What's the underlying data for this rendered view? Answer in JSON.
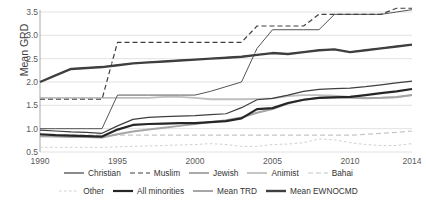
{
  "chart_data": {
    "type": "line",
    "title": "",
    "xlabel": "",
    "ylabel": "Mean GRD",
    "xlim": [
      1990,
      2014
    ],
    "ylim": [
      0.5,
      3.5
    ],
    "yticks": [
      "0.5",
      "1.0",
      "1.5",
      "2.0",
      "2.5",
      "3.0",
      "3.5"
    ],
    "ytick_values": [
      0.5,
      1.0,
      1.5,
      2.0,
      2.5,
      3.0,
      3.5
    ],
    "xticks": [
      "1990",
      "1995",
      "2000",
      "2005",
      "2010",
      "2014"
    ],
    "xtick_values": [
      1990,
      1995,
      2000,
      2005,
      2010,
      2014
    ],
    "grid": "horizontal",
    "legend_position": "bottom",
    "x": [
      1990,
      1991,
      1992,
      1993,
      1994,
      1995,
      1996,
      1997,
      1998,
      1999,
      2000,
      2001,
      2002,
      2003,
      2004,
      2005,
      2006,
      2007,
      2008,
      2009,
      2010,
      2011,
      2012,
      2013,
      2014
    ],
    "series": [
      {
        "name": "Christian",
        "style": "solid-thick-dark",
        "color": "#3f3f3f",
        "values": [
          0.97,
          0.95,
          0.93,
          0.92,
          0.9,
          1.06,
          1.2,
          1.24,
          1.26,
          1.27,
          1.28,
          1.3,
          1.32,
          1.45,
          1.62,
          1.65,
          1.72,
          1.8,
          1.84,
          1.86,
          1.87,
          1.9,
          1.94,
          1.98,
          2.02
        ]
      },
      {
        "name": "Muslim",
        "style": "dashed-dark",
        "color": "#3f3f3f",
        "values": [
          1.63,
          1.63,
          1.63,
          1.63,
          1.63,
          2.85,
          2.85,
          2.85,
          2.85,
          2.85,
          2.85,
          2.85,
          2.85,
          2.85,
          3.2,
          3.2,
          3.2,
          3.2,
          3.45,
          3.45,
          3.45,
          3.45,
          3.45,
          3.58,
          3.58
        ]
      },
      {
        "name": "Jewish",
        "style": "dashdot-dark-thin",
        "color": "#555555",
        "values": [
          1.0,
          1.0,
          1.0,
          1.0,
          1.0,
          1.72,
          1.72,
          1.72,
          1.72,
          1.72,
          1.72,
          1.8,
          1.9,
          2.0,
          2.72,
          3.12,
          3.12,
          3.12,
          3.12,
          3.45,
          3.45,
          3.45,
          3.45,
          3.5,
          3.55
        ]
      },
      {
        "name": "Animist",
        "style": "solid-light",
        "color": "#bfbfbf",
        "values": [
          1.66,
          1.66,
          1.66,
          1.66,
          1.66,
          1.66,
          1.66,
          1.66,
          1.68,
          1.68,
          1.66,
          1.63,
          1.63,
          1.63,
          1.64,
          1.65,
          1.7,
          1.72,
          1.72,
          1.71,
          1.68,
          1.66,
          1.66,
          1.67,
          1.72
        ]
      },
      {
        "name": "Bahai",
        "style": "dashed-light",
        "color": "#c6c6c6",
        "values": [
          0.86,
          0.86,
          0.86,
          0.86,
          0.86,
          0.86,
          0.86,
          0.86,
          0.86,
          0.86,
          0.86,
          0.86,
          0.86,
          0.86,
          0.86,
          0.86,
          0.86,
          0.86,
          0.86,
          0.86,
          0.86,
          0.88,
          0.9,
          0.92,
          0.95
        ]
      },
      {
        "name": "Other",
        "style": "dotted-light",
        "color": "#cfcfcf",
        "values": [
          0.6,
          0.6,
          0.6,
          0.6,
          0.6,
          0.61,
          0.62,
          0.63,
          0.64,
          0.65,
          0.66,
          0.68,
          0.66,
          0.62,
          0.62,
          0.66,
          0.67,
          0.7,
          0.78,
          0.76,
          0.7,
          0.66,
          0.64,
          0.64,
          0.68
        ]
      },
      {
        "name": "All minorities",
        "style": "solid-thick-black",
        "color": "#262626",
        "values": [
          0.88,
          0.86,
          0.85,
          0.84,
          0.83,
          0.98,
          1.08,
          1.1,
          1.11,
          1.12,
          1.12,
          1.14,
          1.16,
          1.22,
          1.42,
          1.44,
          1.55,
          1.62,
          1.66,
          1.67,
          1.68,
          1.72,
          1.76,
          1.8,
          1.85
        ]
      },
      {
        "name": "Mean TRD",
        "style": "solid-light-thick",
        "color": "#a6a6a6",
        "values": [
          0.84,
          0.83,
          0.82,
          0.82,
          0.81,
          0.88,
          0.94,
          0.98,
          1.02,
          1.06,
          1.1,
          1.14,
          1.18,
          1.24,
          1.34,
          1.42,
          1.54,
          1.62,
          1.66,
          1.68,
          1.66,
          1.65,
          1.66,
          1.68,
          1.72
        ]
      },
      {
        "name": "Mean EWNOCMD",
        "style": "solid-double-dark",
        "color": "#3f3f3f",
        "values": [
          2.0,
          2.14,
          2.28,
          2.3,
          2.32,
          2.36,
          2.4,
          2.42,
          2.44,
          2.46,
          2.48,
          2.5,
          2.52,
          2.54,
          2.58,
          2.62,
          2.6,
          2.64,
          2.68,
          2.7,
          2.64,
          2.68,
          2.72,
          2.76,
          2.8
        ]
      }
    ]
  },
  "legend": {
    "row1": [
      {
        "label": "Christian",
        "icon": "line-solid-thick-swatch"
      },
      {
        "label": "Muslim",
        "icon": "line-dashed-swatch"
      },
      {
        "label": "Jewish",
        "icon": "line-dashdot-swatch"
      },
      {
        "label": "Animist",
        "icon": "line-solid-light-swatch"
      },
      {
        "label": "Bahai",
        "icon": "line-dashed-light-swatch"
      }
    ],
    "row2": [
      {
        "label": "Other",
        "icon": "line-dotted-light-swatch"
      },
      {
        "label": "All minorities",
        "icon": "line-solid-black-thick-swatch"
      },
      {
        "label": "Mean TRD",
        "icon": "line-solid-gray-swatch"
      },
      {
        "label": "Mean EWNOCMD",
        "icon": "line-solid-dark-thick-swatch"
      }
    ]
  }
}
